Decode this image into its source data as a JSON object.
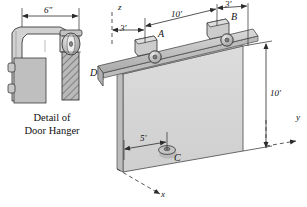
{
  "figure": {
    "detail_caption_line1": "Detail of",
    "detail_caption_line2": "Door Hanger"
  },
  "detail_view": {
    "dimension_width": "6\"",
    "parts": [
      "c-bracket",
      "wheel-roller",
      "hatched-post",
      "door-edge",
      "bolts"
    ]
  },
  "main_view": {
    "points": {
      "A": "A",
      "B": "B",
      "C": "C",
      "D": "D"
    },
    "axes": {
      "x": "x",
      "y": "y",
      "z": "z"
    },
    "dimensions": {
      "left_offset": "3'",
      "span_AB": "10'",
      "right_offset": "3'",
      "door_height": "10'",
      "guide_offset": "5'"
    }
  },
  "colors": {
    "door_face": "#d5d5d5",
    "door_edge": "#b8b8b8",
    "rail_top": "#cfcfcf",
    "rail_side": "#a8a8a8",
    "hanger_body": "#c9c9c9",
    "outline": "#3a3a3a",
    "dim_line": "#2b2b2b"
  }
}
